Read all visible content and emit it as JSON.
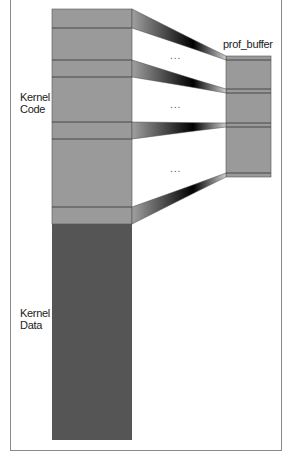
{
  "labels": {
    "kernel_code": [
      "Kernel",
      "Code"
    ],
    "kernel_data": [
      "Kernel",
      "Data"
    ],
    "prof_buffer": "prof_buffer",
    "ellipsis": "..."
  },
  "colors": {
    "code_fill": "#9a9a9a",
    "data_fill": "#555555",
    "buffer_fill": "#9a9a9a",
    "line": "#333333",
    "frame": "#8a8a8a"
  }
}
